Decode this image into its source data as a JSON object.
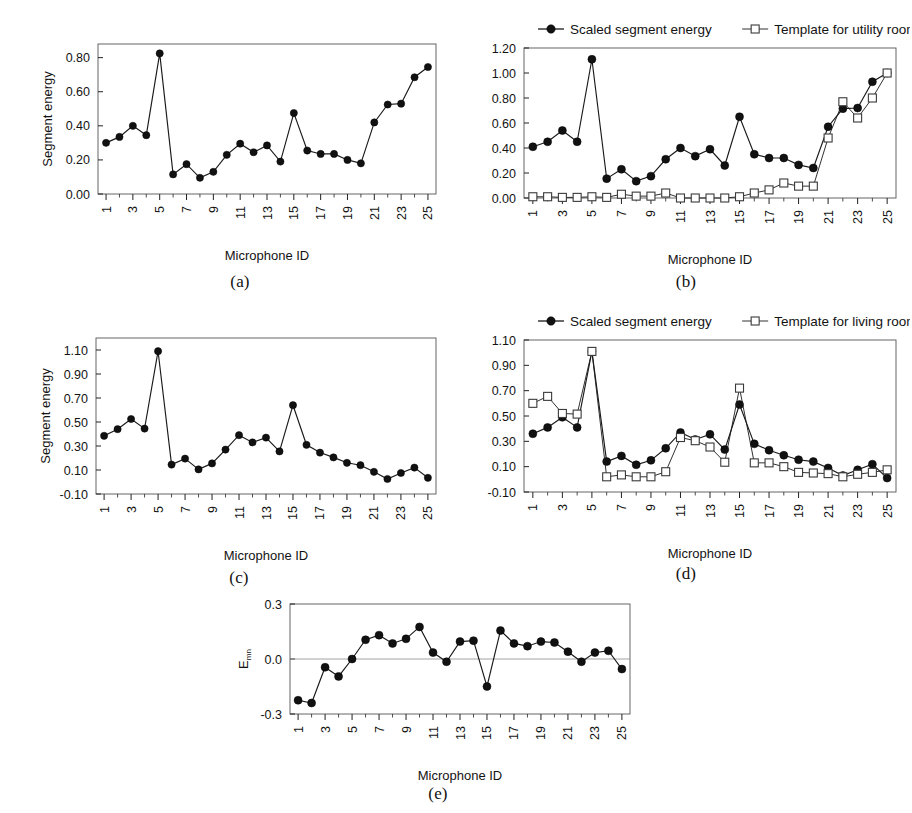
{
  "figure": {
    "background": "#ffffff",
    "line_color": "#1a1a1a",
    "marker_fill_filled": "#111111",
    "marker_fill_open": "#ffffff",
    "axis_color": "#555555"
  },
  "panels": [
    {
      "id": "a",
      "caption": "(a)",
      "has_legend": false,
      "chart_data": {
        "type": "line",
        "title": "",
        "xlabel": "Microphone ID",
        "ylabel": "Segment energy",
        "xlim": [
          0.4,
          25.6
        ],
        "ylim": [
          0.0,
          0.88
        ],
        "yticks": [
          0.0,
          0.2,
          0.4,
          0.6,
          0.8
        ],
        "ytick_labels": [
          "0.00",
          "0.20",
          "0.40",
          "0.60",
          "0.80"
        ],
        "xticks": [
          1,
          3,
          5,
          7,
          9,
          11,
          13,
          15,
          17,
          19,
          21,
          23,
          25
        ],
        "xtick_labels": [
          "1",
          "3",
          "5",
          "7",
          "9",
          "11",
          "13",
          "15",
          "17",
          "19",
          "21",
          "23",
          "25"
        ],
        "grid": false,
        "legend_position": "none",
        "x": [
          1,
          2,
          3,
          4,
          5,
          6,
          7,
          8,
          9,
          10,
          11,
          12,
          13,
          14,
          15,
          16,
          17,
          18,
          19,
          20,
          21,
          22,
          23,
          24,
          25
        ],
        "series": [
          {
            "name": "Segment energy",
            "marker": "filled-circle",
            "values": [
              0.3,
              0.335,
              0.4,
              0.345,
              0.825,
              0.115,
              0.175,
              0.095,
              0.13,
              0.23,
              0.295,
              0.245,
              0.285,
              0.19,
              0.475,
              0.255,
              0.235,
              0.235,
              0.2,
              0.18,
              0.42,
              0.525,
              0.53,
              0.685,
              0.745
            ]
          }
        ]
      }
    },
    {
      "id": "b",
      "caption": "(b)",
      "has_legend": true,
      "legend": [
        {
          "label": "Scaled segment energy",
          "marker": "filled-circle"
        },
        {
          "label": "Template for utility room",
          "marker": "open-square"
        }
      ],
      "chart_data": {
        "type": "line",
        "title": "",
        "xlabel": "Microphone ID",
        "ylabel": "",
        "xlim": [
          0.4,
          25.6
        ],
        "ylim": [
          0.0,
          1.2
        ],
        "yticks": [
          0.0,
          0.2,
          0.4,
          0.6,
          0.8,
          1.0,
          1.2
        ],
        "ytick_labels": [
          "0.00",
          "0.20",
          "0.40",
          "0.60",
          "0.80",
          "1.00",
          "1.20"
        ],
        "xticks": [
          1,
          3,
          5,
          7,
          9,
          11,
          13,
          15,
          17,
          19,
          21,
          23,
          25
        ],
        "xtick_labels": [
          "1",
          "3",
          "5",
          "7",
          "9",
          "11",
          "13",
          "15",
          "17",
          "19",
          "21",
          "23",
          "25"
        ],
        "grid": false,
        "legend_position": "top",
        "x": [
          1,
          2,
          3,
          4,
          5,
          6,
          7,
          8,
          9,
          10,
          11,
          12,
          13,
          14,
          15,
          16,
          17,
          18,
          19,
          20,
          21,
          22,
          23,
          24,
          25
        ],
        "series": [
          {
            "name": "Scaled segment energy",
            "marker": "filled-circle",
            "values": [
              0.41,
              0.45,
              0.54,
              0.45,
              1.11,
              0.155,
              0.23,
              0.135,
              0.175,
              0.31,
              0.4,
              0.335,
              0.39,
              0.26,
              0.65,
              0.35,
              0.32,
              0.32,
              0.265,
              0.24,
              0.57,
              0.715,
              0.72,
              0.93,
              1.0
            ]
          },
          {
            "name": "Template for utility room",
            "marker": "open-square",
            "values": [
              0.01,
              0.01,
              0.005,
              0.005,
              0.01,
              0.005,
              0.03,
              0.015,
              0.015,
              0.04,
              0.0,
              0.0,
              0.0,
              0.0,
              0.01,
              0.04,
              0.065,
              0.12,
              0.095,
              0.095,
              0.48,
              0.77,
              0.64,
              0.8,
              1.0
            ]
          }
        ]
      }
    },
    {
      "id": "c",
      "caption": "(c)",
      "has_legend": false,
      "chart_data": {
        "type": "line",
        "title": "",
        "xlabel": "Microphone ID",
        "ylabel": "Segment energy",
        "xlim": [
          0.4,
          25.6
        ],
        "ylim": [
          -0.1,
          1.2
        ],
        "yticks": [
          -0.1,
          0.1,
          0.3,
          0.5,
          0.7,
          0.9,
          1.1
        ],
        "ytick_labels": [
          "-0.10",
          "0.10",
          "0.30",
          "0.50",
          "0.70",
          "0.90",
          "1.10"
        ],
        "xticks": [
          1,
          3,
          5,
          7,
          9,
          11,
          13,
          15,
          17,
          19,
          21,
          23,
          25
        ],
        "xtick_labels": [
          "1",
          "3",
          "5",
          "7",
          "9",
          "11",
          "13",
          "15",
          "17",
          "19",
          "21",
          "23",
          "25"
        ],
        "grid": false,
        "legend_position": "none",
        "x": [
          1,
          2,
          3,
          4,
          5,
          6,
          7,
          8,
          9,
          10,
          11,
          12,
          13,
          14,
          15,
          16,
          17,
          18,
          19,
          20,
          21,
          22,
          23,
          24,
          25
        ],
        "series": [
          {
            "name": "Segment energy",
            "marker": "filled-circle",
            "values": [
              0.385,
              0.44,
              0.525,
              0.445,
              1.09,
              0.145,
              0.195,
              0.105,
              0.155,
              0.27,
              0.39,
              0.33,
              0.37,
              0.255,
              0.64,
              0.31,
              0.245,
              0.205,
              0.16,
              0.14,
              0.085,
              0.025,
              0.075,
              0.12,
              0.035
            ]
          }
        ]
      }
    },
    {
      "id": "d",
      "caption": "(d)",
      "has_legend": true,
      "legend": [
        {
          "label": "Scaled segment energy",
          "marker": "filled-circle"
        },
        {
          "label": "Template for living room",
          "marker": "open-square"
        }
      ],
      "chart_data": {
        "type": "line",
        "title": "",
        "xlabel": "Microphone ID",
        "ylabel": "",
        "xlim": [
          0.4,
          25.6
        ],
        "ylim": [
          -0.1,
          1.1
        ],
        "yticks": [
          -0.1,
          0.1,
          0.3,
          0.5,
          0.7,
          0.9,
          1.1
        ],
        "ytick_labels": [
          "-0.10",
          "0.10",
          "0.30",
          "0.50",
          "0.70",
          "0.90",
          "1.10"
        ],
        "xticks": [
          1,
          3,
          5,
          7,
          9,
          11,
          13,
          15,
          17,
          19,
          21,
          23,
          25
        ],
        "xtick_labels": [
          "1",
          "3",
          "5",
          "7",
          "9",
          "11",
          "13",
          "15",
          "17",
          "19",
          "21",
          "23",
          "25"
        ],
        "grid": false,
        "legend_position": "top",
        "x": [
          1,
          2,
          3,
          4,
          5,
          6,
          7,
          8,
          9,
          10,
          11,
          12,
          13,
          14,
          15,
          16,
          17,
          18,
          19,
          20,
          21,
          22,
          23,
          24,
          25
        ],
        "series": [
          {
            "name": "Scaled segment energy",
            "marker": "filled-circle",
            "values": [
              0.36,
              0.41,
              0.49,
              0.41,
              1.01,
              0.14,
              0.185,
              0.115,
              0.15,
              0.245,
              0.37,
              0.315,
              0.355,
              0.235,
              0.59,
              0.28,
              0.23,
              0.19,
              0.155,
              0.14,
              0.09,
              0.03,
              0.075,
              0.12,
              0.01
            ]
          },
          {
            "name": "Template for living room",
            "marker": "open-square",
            "values": [
              0.6,
              0.655,
              0.52,
              0.515,
              1.01,
              0.02,
              0.035,
              0.02,
              0.02,
              0.06,
              0.33,
              0.305,
              0.255,
              0.135,
              0.72,
              0.13,
              0.13,
              0.1,
              0.055,
              0.05,
              0.045,
              0.02,
              0.04,
              0.055,
              0.075
            ]
          }
        ]
      }
    },
    {
      "id": "e",
      "caption": "(e)",
      "has_legend": false,
      "chart_data": {
        "type": "line",
        "title": "",
        "xlabel": "Microphone ID",
        "ylabel": "E",
        "ylabel_subscript": "mn",
        "xlim": [
          0.4,
          25.6
        ],
        "ylim": [
          -0.3,
          0.3
        ],
        "yticks": [
          -0.3,
          0.0,
          0.3
        ],
        "ytick_labels": [
          "-0.3",
          "0.0",
          "0.3"
        ],
        "xticks": [
          1,
          3,
          5,
          7,
          9,
          11,
          13,
          15,
          17,
          19,
          21,
          23,
          25
        ],
        "xtick_labels": [
          "1",
          "3",
          "5",
          "7",
          "9",
          "11",
          "13",
          "15",
          "17",
          "19",
          "21",
          "23",
          "25"
        ],
        "grid": false,
        "zero_line": true,
        "legend_position": "none",
        "x": [
          1,
          2,
          3,
          4,
          5,
          6,
          7,
          8,
          9,
          10,
          11,
          12,
          13,
          14,
          15,
          16,
          17,
          18,
          19,
          20,
          21,
          22,
          23,
          24,
          25
        ],
        "series": [
          {
            "name": "Emn",
            "marker": "filled-circle",
            "values": [
              -0.225,
              -0.24,
              -0.045,
              -0.095,
              0.0,
              0.105,
              0.13,
              0.085,
              0.11,
              0.175,
              0.035,
              -0.015,
              0.095,
              0.1,
              -0.15,
              0.155,
              0.085,
              0.07,
              0.095,
              0.09,
              0.04,
              -0.015,
              0.035,
              0.045,
              -0.055
            ]
          }
        ]
      }
    }
  ]
}
